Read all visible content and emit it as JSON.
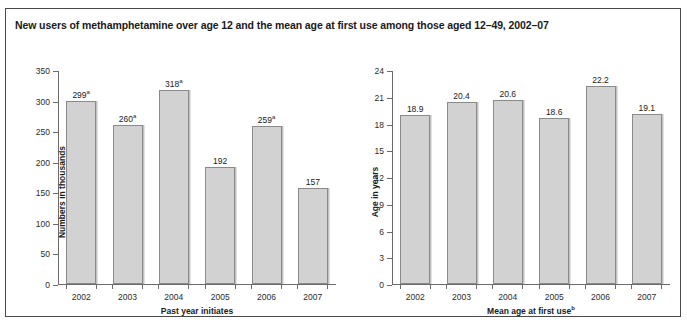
{
  "figure": {
    "title": "New users of methamphetamine over age 12 and the mean age at first use among those aged 12–49, 2002–07",
    "border_color": "#4a4a4a",
    "bar_fill": "#d2d2d2",
    "bar_stroke": "#8a8a8a"
  },
  "chart_data": [
    {
      "type": "bar",
      "title": "",
      "panel": "left",
      "xlabel": "Past year initiates",
      "xlabel_footnote": "",
      "ylabel": "Numbers in thousands",
      "categories": [
        "2002",
        "2003",
        "2004",
        "2005",
        "2006",
        "2007"
      ],
      "values": [
        299,
        260,
        318,
        192,
        259,
        157
      ],
      "data_labels": [
        "299",
        "260",
        "318",
        "192",
        "259",
        "157"
      ],
      "label_footnotes": [
        "a",
        "a",
        "a",
        "",
        "a",
        ""
      ],
      "ylim": [
        0,
        350
      ],
      "yticks": [
        0,
        50,
        100,
        150,
        200,
        250,
        300,
        350
      ],
      "ytick_labels": [
        "0",
        "50",
        "100",
        "150",
        "200",
        "250",
        "300",
        "350"
      ],
      "grid": false,
      "legend": false
    },
    {
      "type": "bar",
      "title": "",
      "panel": "right",
      "xlabel": "Mean age at first use",
      "xlabel_footnote": "b",
      "ylabel": "Age in years",
      "categories": [
        "2002",
        "2003",
        "2004",
        "2005",
        "2006",
        "2007"
      ],
      "values": [
        18.9,
        20.4,
        20.6,
        18.6,
        22.2,
        19.1
      ],
      "data_labels": [
        "18.9",
        "20.4",
        "20.6",
        "18.6",
        "22.2",
        "19.1"
      ],
      "label_footnotes": [
        "",
        "",
        "",
        "",
        "",
        ""
      ],
      "ylim": [
        0,
        24
      ],
      "yticks": [
        0,
        3,
        6,
        9,
        12,
        15,
        18,
        21,
        24
      ],
      "ytick_labels": [
        "0",
        "3",
        "6",
        "9",
        "12",
        "15",
        "18",
        "21",
        "24"
      ],
      "grid": false,
      "legend": false
    }
  ]
}
